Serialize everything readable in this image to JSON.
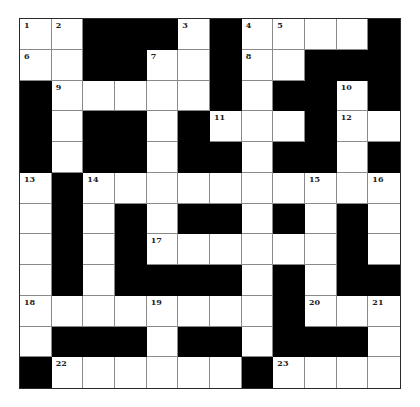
{
  "puzzle": {
    "rows": 12,
    "cols": 12,
    "colors": {
      "black": "#000000",
      "white": "#ffffff",
      "grid_line": "#8a8a8a",
      "number": "#222222"
    },
    "grid": [
      [
        "1",
        "2",
        "#",
        "#",
        "#",
        "3",
        "#",
        "4",
        "5",
        ".",
        ".",
        "#"
      ],
      [
        "6",
        ".",
        "#",
        "#",
        "7",
        ".",
        "#",
        "8",
        ".",
        "#",
        "#",
        "#"
      ],
      [
        "#",
        "9",
        ".",
        ".",
        ".",
        ".",
        "#",
        ".",
        "#",
        "#",
        "10",
        "#"
      ],
      [
        "#",
        ".",
        "#",
        "#",
        ".",
        "#",
        "11",
        ".",
        ".",
        "#",
        "12",
        "."
      ],
      [
        "#",
        ".",
        "#",
        "#",
        ".",
        "#",
        "#",
        ".",
        "#",
        "#",
        ".",
        "#"
      ],
      [
        "13",
        "#",
        "14",
        ".",
        ".",
        ".",
        ".",
        ".",
        ".",
        "15",
        ".",
        "16"
      ],
      [
        ".",
        "#",
        ".",
        "#",
        ".",
        "#",
        "#",
        ".",
        "#",
        ".",
        "#",
        "."
      ],
      [
        ".",
        "#",
        ".",
        "#",
        "17",
        ".",
        ".",
        ".",
        ".",
        ".",
        "#",
        "."
      ],
      [
        ".",
        "#",
        ".",
        "#",
        "#",
        "#",
        "#",
        ".",
        "#",
        ".",
        "#",
        "#"
      ],
      [
        "18",
        ".",
        ".",
        ".",
        "19",
        ".",
        ".",
        ".",
        "#",
        "20",
        ".",
        "21"
      ],
      [
        ".",
        "#",
        "#",
        "#",
        ".",
        "#",
        "#",
        ".",
        "#",
        "#",
        "#",
        "."
      ],
      [
        "#",
        "22",
        ".",
        ".",
        ".",
        ".",
        ".",
        "#",
        "23",
        ".",
        ".",
        "."
      ]
    ]
  }
}
